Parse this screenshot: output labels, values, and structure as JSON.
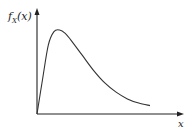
{
  "chart_data": {
    "type": "line",
    "title": "",
    "ylabel": "f_X(x)",
    "ylabel_main": "f",
    "ylabel_sub": "X",
    "ylabel_arg": "(x)",
    "xlabel": "x",
    "grid": false,
    "ticks": false,
    "x": [
      0,
      0.05,
      0.1,
      0.15,
      0.2,
      0.25,
      0.3,
      0.4,
      0.5,
      0.6,
      0.7,
      0.8,
      0.9,
      1.0
    ],
    "y": [
      0,
      0.42,
      0.82,
      0.98,
      1.0,
      0.96,
      0.88,
      0.7,
      0.52,
      0.37,
      0.26,
      0.18,
      0.13,
      0.1
    ],
    "xlim": [
      0,
      1.1
    ],
    "ylim": [
      0,
      1.1
    ]
  }
}
